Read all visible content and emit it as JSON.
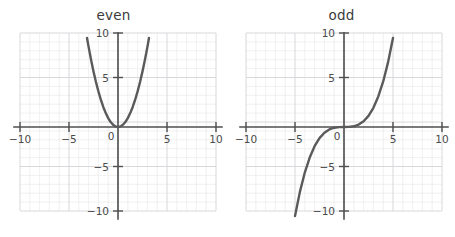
{
  "figure": {
    "width": 455,
    "height": 237,
    "background": "#ffffff",
    "curve_color": "#5a5a5a",
    "axis_color": "#4f4f4f",
    "major_grid_color": "#d8d8dc",
    "minor_grid_color": "#ececed",
    "tick_label_color": "#4a4a4a",
    "title_color": "#3b3b3b"
  },
  "panels": [
    {
      "id": "even-panel",
      "title": "even",
      "x_tick_labels": [
        "−10",
        "−5",
        "0",
        "5",
        "10"
      ],
      "y_tick_labels": [
        "10",
        "5",
        "−5",
        "−10"
      ],
      "origin_label": "0"
    },
    {
      "id": "odd-panel",
      "title": "odd",
      "x_tick_labels": [
        "−10",
        "−5",
        "0",
        "5",
        "10"
      ],
      "y_tick_labels": [
        "10",
        "5",
        "−5",
        "−10"
      ],
      "origin_label": "0"
    }
  ],
  "chart_data": [
    {
      "type": "line",
      "title": "even",
      "xlabel": "",
      "ylabel": "",
      "xlim": [
        -10,
        10
      ],
      "ylim": [
        -10,
        10
      ],
      "xticks": [
        -10,
        -5,
        0,
        5,
        10
      ],
      "yticks": [
        -10,
        -5,
        0,
        5,
        10
      ],
      "grid": true,
      "grid_minor_step": 1,
      "grid_major_step": 5,
      "legend": "none",
      "series": [
        {
          "name": "even function (parabola)",
          "expression": "y = x^2",
          "symmetry": "even",
          "x": [
            -3.162,
            -3.0,
            -2.75,
            -2.5,
            -2.25,
            -2.0,
            -1.75,
            -1.5,
            -1.25,
            -1.0,
            -0.75,
            -0.5,
            -0.25,
            0.0,
            0.25,
            0.5,
            0.75,
            1.0,
            1.25,
            1.5,
            1.75,
            2.0,
            2.25,
            2.5,
            2.75,
            3.0,
            3.162
          ],
          "y": [
            10.0,
            9.0,
            7.5625,
            6.25,
            5.0625,
            4.0,
            3.0625,
            2.25,
            1.5625,
            1.0,
            0.5625,
            0.25,
            0.0625,
            0.0,
            0.0625,
            0.25,
            0.5625,
            1.0,
            1.5625,
            2.25,
            3.0625,
            4.0,
            5.0625,
            6.25,
            7.5625,
            9.0,
            10.0
          ]
        }
      ]
    },
    {
      "type": "line",
      "title": "odd",
      "xlabel": "",
      "ylabel": "",
      "xlim": [
        -10,
        10
      ],
      "ylim": [
        -10,
        10
      ],
      "xticks": [
        -10,
        -5,
        0,
        5,
        10
      ],
      "yticks": [
        -10,
        -5,
        0,
        5,
        10
      ],
      "grid": true,
      "grid_minor_step": 1,
      "grid_major_step": 5,
      "legend": "none",
      "series": [
        {
          "name": "odd function (cubic)",
          "expression": "y = x^3/12.5",
          "symmetry": "odd",
          "x": [
            -5.3,
            -5.0,
            -4.5,
            -4.0,
            -3.5,
            -3.0,
            -2.5,
            -2.0,
            -1.5,
            -1.0,
            -0.5,
            0.0,
            0.5,
            1.0,
            1.5,
            2.0,
            2.5,
            3.0,
            3.5,
            4.0,
            4.5,
            5.0,
            5.3
          ],
          "y": [
            -11.9,
            -10.0,
            -7.29,
            -5.12,
            -3.43,
            -2.16,
            -1.25,
            -0.64,
            -0.27,
            -0.08,
            -0.01,
            0.0,
            0.01,
            0.08,
            0.27,
            0.64,
            1.25,
            2.16,
            3.43,
            5.12,
            7.29,
            10.0,
            11.9
          ]
        }
      ]
    }
  ]
}
